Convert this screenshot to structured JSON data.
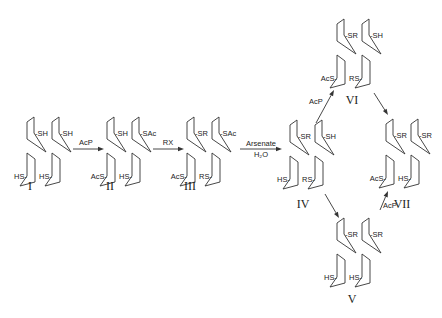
{
  "structures": [
    {
      "id": "I",
      "label": "I",
      "x": 27,
      "y": 122,
      "ul": "-SH",
      "ur": "-SH",
      "ll": "HS-",
      "lr": "HS-",
      "lx": 30,
      "ly": 190
    },
    {
      "id": "II",
      "label": "II",
      "x": 107,
      "y": 122,
      "ul": "-SH",
      "ur": "-SAc",
      "ll": "AcS-",
      "lr": "HS-",
      "lx": 110,
      "ly": 190
    },
    {
      "id": "III",
      "label": "III",
      "x": 187,
      "y": 122,
      "ul": "-SR",
      "ur": "-SAc",
      "ll": "AcS-",
      "lr": "RS-",
      "lx": 190,
      "ly": 190
    },
    {
      "id": "IV",
      "label": "IV",
      "x": 290,
      "y": 125,
      "ul": "-SR",
      "ur": "-SH",
      "ll": "HS-",
      "lr": "RS-",
      "lx": 303,
      "ly": 208
    },
    {
      "id": "VI",
      "label": "VI",
      "x": 337,
      "y": 24,
      "ul": "-SR",
      "ur": "-SH",
      "ll": "AcS-",
      "lr": "RS-",
      "lx": 352,
      "ly": 104
    },
    {
      "id": "VII",
      "label": "VII",
      "x": 386,
      "y": 124,
      "ul": "-SR",
      "ur": "-SR",
      "ll": "AcS-",
      "lr": "HS-",
      "lx": 402,
      "ly": 208
    },
    {
      "id": "V",
      "label": "V",
      "x": 337,
      "y": 223,
      "ul": "-SR",
      "ur": "-SR",
      "ll": "HS-",
      "lr": "HS-",
      "lx": 352,
      "ly": 303
    }
  ],
  "arrows": [
    {
      "id": "I-II",
      "from": [
        73,
        149
      ],
      "to": [
        104,
        149
      ],
      "label": "AcP",
      "label2": "",
      "lx": 86,
      "ly": 145
    },
    {
      "id": "II-III",
      "from": [
        153,
        149
      ],
      "to": [
        184,
        149
      ],
      "label": "RX",
      "label2": "",
      "lx": 168,
      "ly": 145
    },
    {
      "id": "III-IV",
      "from": [
        240,
        149
      ],
      "to": [
        282,
        149
      ],
      "label": "Arsenate",
      "label2": "H₂O",
      "lx": 261,
      "ly": 146
    },
    {
      "id": "IV-VI",
      "from": [
        316,
        123
      ],
      "to": [
        334,
        90
      ],
      "label": "AcP",
      "label2": "",
      "lx": 316,
      "ly": 104
    },
    {
      "id": "VI-VII",
      "from": [
        374,
        93
      ],
      "to": [
        388,
        115
      ],
      "label": "",
      "label2": "",
      "lx": 0,
      "ly": 0
    },
    {
      "id": "IV-V",
      "from": [
        325,
        194
      ],
      "to": [
        339,
        218
      ],
      "label": "",
      "label2": "",
      "lx": 0,
      "ly": 0
    },
    {
      "id": "V-VII",
      "from": [
        380,
        210
      ],
      "to": [
        388,
        191
      ],
      "label": "AcP",
      "label2": "",
      "lx": 390,
      "ly": 208
    }
  ]
}
